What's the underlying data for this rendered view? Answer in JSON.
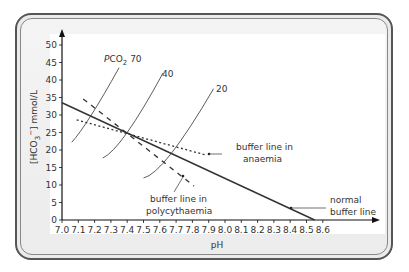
{
  "chart_data": {
    "type": "line",
    "title": "",
    "xlabel": "pH",
    "ylabel": "[HCO3⁻] mmol/L",
    "ylabel_parts": {
      "pre": "[HCO",
      "sub": "3",
      "sup": "−",
      "post": "] mmol/L"
    },
    "xlim": [
      7.0,
      8.7
    ],
    "ylim": [
      0,
      52
    ],
    "x_ticks": [
      7.0,
      7.1,
      7.2,
      7.3,
      7.4,
      7.5,
      7.6,
      7.7,
      7.8,
      7.9,
      8.0,
      8.1,
      8.2,
      8.3,
      8.4,
      8.5,
      8.6
    ],
    "x_tick_labels": [
      "7.0",
      "7.1",
      "7.2",
      "7.3",
      "7.4",
      "7.5",
      "7.6",
      "7.7",
      "7.8",
      "7.9",
      "8.0",
      "8.1",
      "8.2",
      "8.3",
      "8.4",
      "8.5",
      "8.6"
    ],
    "y_ticks": [
      0,
      5,
      10,
      15,
      20,
      25,
      30,
      35,
      40,
      45,
      50
    ],
    "y_tick_labels": [
      "0",
      "5",
      "10",
      "15",
      "20",
      "25",
      "30",
      "35",
      "40",
      "45",
      "50"
    ],
    "grid": false,
    "series": [
      {
        "name": "normal buffer line",
        "style": "solid",
        "x": [
          7.0,
          8.55
        ],
        "y": [
          33.5,
          0
        ]
      },
      {
        "name": "buffer line in anaemia",
        "style": "dotted",
        "x": [
          7.09,
          7.88
        ],
        "y": [
          28.6,
          18.6
        ]
      },
      {
        "name": "buffer line in polycythaemia",
        "style": "dashed",
        "x": [
          7.13,
          7.81
        ],
        "y": [
          34.6,
          9.7
        ]
      },
      {
        "name": "PCO2 70",
        "style": "isobar",
        "x": [
          7.06,
          7.18,
          7.35
        ],
        "y": [
          22.2,
          30,
          43.5
        ]
      },
      {
        "name": "PCO2 40",
        "style": "isobar",
        "x": [
          7.25,
          7.4,
          7.62
        ],
        "y": [
          17.7,
          25,
          42
        ]
      },
      {
        "name": "PCO2 20",
        "style": "isobar",
        "x": [
          7.5,
          7.67,
          7.93
        ],
        "y": [
          12,
          19,
          37.5
        ]
      }
    ],
    "annotations": {
      "pco2_70": {
        "pre": "P",
        "mid": "CO",
        "sub": "2",
        "post": " 70"
      },
      "pco2_40": "40",
      "pco2_20": "20",
      "anaemia": [
        "buffer line in",
        "anaemia"
      ],
      "polycythaemia": [
        "buffer line in",
        "polycythaemia"
      ],
      "normal": [
        "normal",
        "buffer line"
      ]
    }
  }
}
